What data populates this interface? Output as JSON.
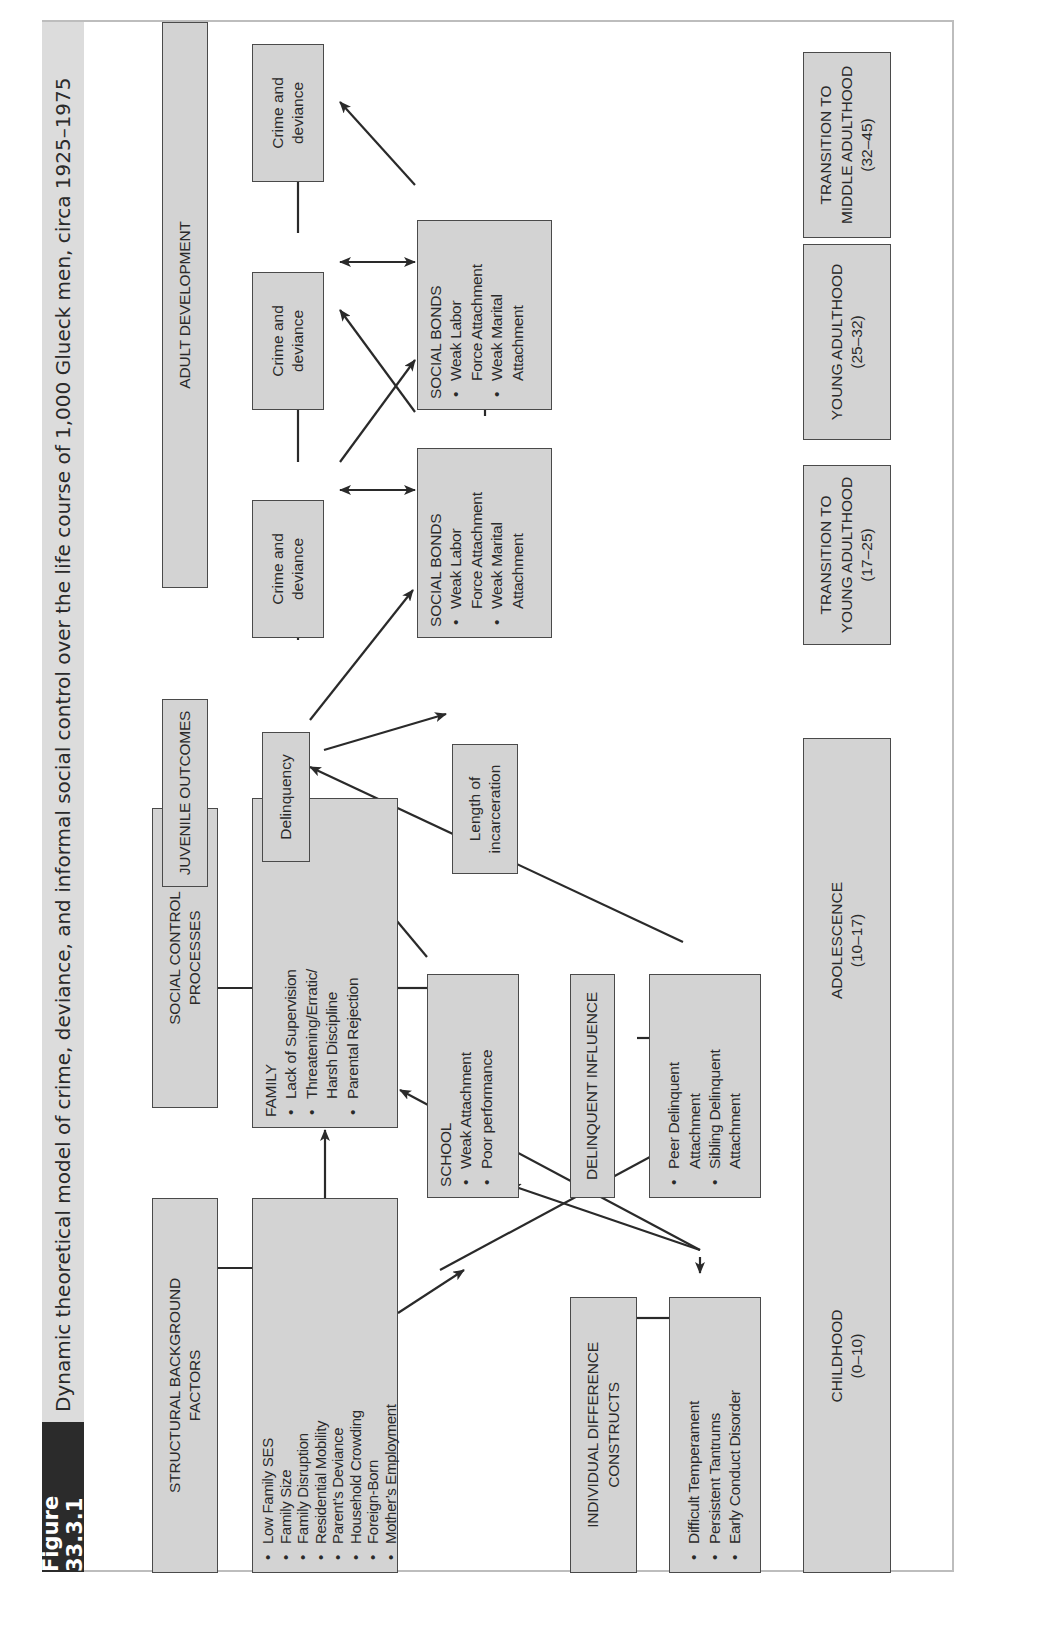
{
  "figure": {
    "tag": "Figure 33.3.1",
    "caption": "Dynamic theoretical model of crime, deviance, and informal social control over the life course of 1,000 Glueck men, circa 1925–1975"
  },
  "column_headers": {
    "structural": [
      "STRUCTURAL BACKGROUND",
      "FACTORS"
    ],
    "social_control": [
      "SOCIAL CONTROL",
      "PROCESSES"
    ],
    "juvenile": [
      "JUVENILE OUTCOMES"
    ],
    "adult": [
      "ADULT DEVELOPMENT"
    ],
    "individual": [
      "INDIVIDUAL DIFFERENCE",
      "CONSTRUCTS"
    ],
    "delinquent_influence": [
      "DELINQUENT INFLUENCE"
    ]
  },
  "nodes": {
    "structural_factors": {
      "items": [
        "Low Family SES",
        "Family Size",
        "Family Disruption",
        "Residential Mobility",
        "Parent’s Deviance",
        "Household Crowding",
        "Foreign-Born",
        "Mother’s Employment"
      ]
    },
    "family": {
      "title": "FAMILY",
      "items": [
        "Lack of Supervision",
        "Threatening/Erratic/ Harsh Discipline",
        "Parental Rejection"
      ]
    },
    "school": {
      "title": "SCHOOL",
      "items": [
        "Weak Attachment",
        "Poor performance"
      ]
    },
    "individual_constructs": {
      "items": [
        "Difficult Temperament",
        "Persistent Tantrums",
        "Early Conduct Disorder"
      ]
    },
    "delinquent_influence": {
      "items": [
        "Peer Delinquent Attachment",
        "Sibling Delinquent Attachment"
      ]
    },
    "delinquency": {
      "label": "Delinquency"
    },
    "incarceration": {
      "lines": [
        "Length of",
        "incarceration"
      ]
    },
    "crime_1": {
      "lines": [
        "Crime and",
        "deviance"
      ]
    },
    "crime_2": {
      "lines": [
        "Crime and",
        "deviance"
      ]
    },
    "crime_3": {
      "lines": [
        "Crime and",
        "deviance"
      ]
    },
    "social_bonds_1": {
      "title": "SOCIAL BONDS",
      "items": [
        "Weak Labor Force Attachment",
        "Weak Marital Attachment"
      ]
    },
    "social_bonds_2": {
      "title": "SOCIAL BONDS",
      "items": [
        "Weak Labor Force Attachment",
        "Weak Marital Attachment"
      ]
    }
  },
  "timeline": {
    "childhood": [
      "CHILDHOOD",
      "(0–10)"
    ],
    "adolescence": [
      "ADOLESCENCE",
      "(10–17)"
    ],
    "transition_young": [
      "TRANSITION TO",
      "YOUNG ADULTHOOD",
      "(17–25)"
    ],
    "young_adulthood": [
      "YOUNG ADULTHOOD",
      "(25–32)"
    ],
    "transition_middle": [
      "TRANSITION TO",
      "MIDDLE ADULTHOOD",
      "(32–45)"
    ]
  },
  "colors": {
    "box_fill": "#d3d3d3",
    "box_border": "#4a4a4a",
    "tag_bg": "#2b2b2b",
    "caption_bg": "#dcdcdc",
    "line": "#2a2a2a"
  }
}
